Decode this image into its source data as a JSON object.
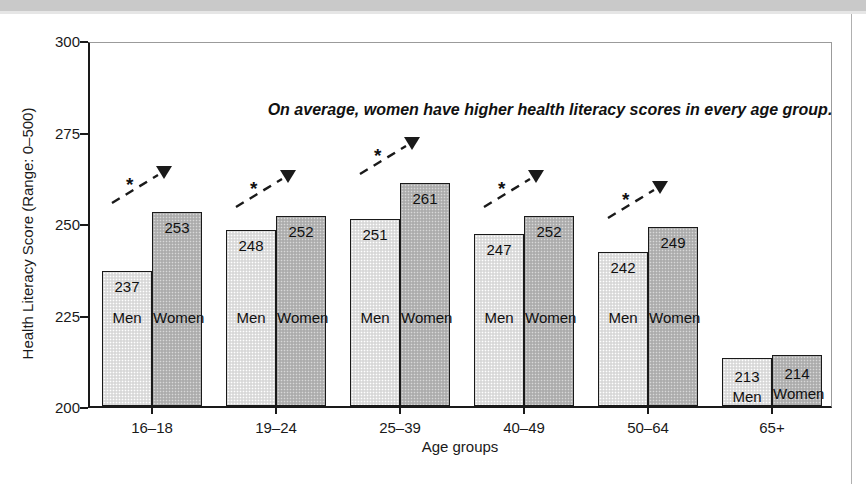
{
  "chart_data": {
    "type": "bar",
    "title": "",
    "annotation": "On average, women have higher health literacy scores in every age group.",
    "xlabel": "Age groups",
    "ylabel": "Health Literacy Score (Range: 0–500)",
    "ylim": [
      200,
      300
    ],
    "yticks": [
      200,
      225,
      250,
      275,
      300
    ],
    "ytick_labels": [
      "200",
      "225",
      "250",
      "275",
      "300"
    ],
    "grid": false,
    "legend": "none",
    "categories": [
      "16–18",
      "19–24",
      "25–39",
      "40–49",
      "50–64",
      "65+"
    ],
    "series": [
      {
        "name": "Men",
        "values": [
          237,
          248,
          251,
          247,
          242,
          213
        ]
      },
      {
        "name": "Women",
        "values": [
          253,
          252,
          261,
          252,
          249,
          214
        ]
      }
    ],
    "significance_marker": "*",
    "significance_groups": [
      "16–18",
      "19–24",
      "25–39",
      "40–49",
      "50–64"
    ],
    "bars": [
      {
        "group": "16–18",
        "sex": "Men",
        "value": 237,
        "value_label": "237",
        "sex_label": "Men"
      },
      {
        "group": "16–18",
        "sex": "Women",
        "value": 253,
        "value_label": "253",
        "sex_label": "Women"
      },
      {
        "group": "19–24",
        "sex": "Men",
        "value": 248,
        "value_label": "248",
        "sex_label": "Men"
      },
      {
        "group": "19–24",
        "sex": "Women",
        "value": 252,
        "value_label": "252",
        "sex_label": "Women"
      },
      {
        "group": "25–39",
        "sex": "Men",
        "value": 251,
        "value_label": "251",
        "sex_label": "Men"
      },
      {
        "group": "25–39",
        "sex": "Women",
        "value": 261,
        "value_label": "261",
        "sex_label": "Women"
      },
      {
        "group": "40–49",
        "sex": "Men",
        "value": 247,
        "value_label": "247",
        "sex_label": "Men"
      },
      {
        "group": "40–49",
        "sex": "Women",
        "value": 252,
        "value_label": "252",
        "sex_label": "Women"
      },
      {
        "group": "50–64",
        "sex": "Men",
        "value": 242,
        "value_label": "242",
        "sex_label": "Men"
      },
      {
        "group": "50–64",
        "sex": "Women",
        "value": 249,
        "value_label": "249",
        "sex_label": "Women"
      },
      {
        "group": "65+",
        "sex": "Men",
        "value": 213,
        "value_label": "213",
        "sex_label": "Men"
      },
      {
        "group": "65+",
        "sex": "Women",
        "value": 214,
        "value_label": "214",
        "sex_label": "Women"
      }
    ],
    "colors": {
      "men_fill": "#e2e2e2",
      "women_fill": "#b6b6b6",
      "outline": "#1a1a1a",
      "text": "#111111"
    }
  }
}
